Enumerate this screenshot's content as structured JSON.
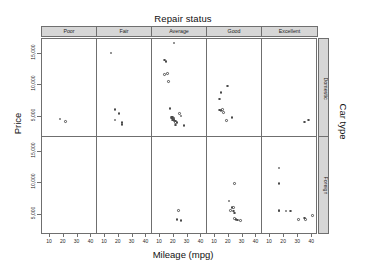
{
  "titles": {
    "top": "Repair status",
    "left": "Price",
    "bottom": "Mileage (mpg)",
    "right": "Car type"
  },
  "colors": {
    "strip_fill": "#d6d6d6",
    "frame": "#6f6f6f",
    "point": "#4a4a4a",
    "background": "#ffffff",
    "text": "#1f1f1f"
  },
  "chart_data": {
    "type": "scatter",
    "title": "Repair status",
    "xlabel": "Mileage (mpg)",
    "ylabel": "Price",
    "right_label": "Car type",
    "grid": false,
    "legend": "none",
    "layout": "trellis 5 columns x 2 rows",
    "columns": [
      "Poor",
      "Fair",
      "Average",
      "Good",
      "Excellent"
    ],
    "rows": [
      "Domestic",
      "Foreign"
    ],
    "xlim": [
      5,
      44
    ],
    "ylim": [
      2500,
      16500
    ],
    "xticks": [
      10,
      20,
      30,
      40
    ],
    "xticklabels": [
      "10",
      "20",
      "30",
      "40"
    ],
    "yticks": [
      5000,
      10000,
      15000
    ],
    "yticklabels": [
      "5,000",
      "10,000",
      "15,000"
    ],
    "panels": [
      {
        "row": "Domestic",
        "col": "Poor",
        "n": 2,
        "points": [
          [
            18,
            4934
          ],
          [
            22,
            4589
          ]
        ]
      },
      {
        "row": "Domestic",
        "col": "Fair",
        "n": 6,
        "points": [
          [
            15,
            14500
          ],
          [
            18,
            6303
          ],
          [
            18,
            4816
          ],
          [
            21,
            5705
          ],
          [
            23,
            4453
          ],
          [
            23,
            4195
          ]
        ]
      },
      {
        "row": "Domestic",
        "col": "Average",
        "n": 23,
        "points": [
          [
            21,
            15906
          ],
          [
            14,
            13466
          ],
          [
            15,
            13291
          ],
          [
            14,
            11385
          ],
          [
            16,
            11497
          ],
          [
            17,
            10372
          ],
          [
            18,
            6486
          ],
          [
            19,
            5222
          ],
          [
            19,
            5079
          ],
          [
            20,
            4816
          ],
          [
            20,
            5104
          ],
          [
            20,
            5222
          ],
          [
            21,
            4723
          ],
          [
            21,
            4800
          ],
          [
            21,
            4934
          ],
          [
            21,
            5104
          ],
          [
            22,
            4647
          ],
          [
            22,
            4425
          ],
          [
            23,
            4482
          ],
          [
            25,
            5788
          ],
          [
            26,
            5379
          ],
          [
            22,
            4060
          ],
          [
            28,
            3984
          ]
        ]
      },
      {
        "row": "Domestic",
        "col": "Good",
        "n": 8,
        "points": [
          [
            20,
            9690
          ],
          [
            15,
            8814
          ],
          [
            14,
            7827
          ],
          [
            14,
            6229
          ],
          [
            16,
            6295
          ],
          [
            15,
            6165
          ],
          [
            17,
            5899
          ],
          [
            19,
            4741
          ],
          [
            23,
            5172
          ]
        ]
      },
      {
        "row": "Domestic",
        "col": "Excellent",
        "n": 2,
        "points": [
          [
            35,
            4504
          ],
          [
            38,
            4816
          ]
        ]
      },
      {
        "row": "Foreign",
        "col": "Poor",
        "n": 0,
        "points": []
      },
      {
        "row": "Foreign",
        "col": "Fair",
        "n": 0,
        "points": []
      },
      {
        "row": "Foreign",
        "col": "Average",
        "n": 3,
        "points": [
          [
            24,
            5799
          ],
          [
            23,
            4499
          ],
          [
            26,
            4296
          ]
        ]
      },
      {
        "row": "Foreign",
        "col": "Good",
        "n": 11,
        "points": [
          [
            25,
            9735
          ],
          [
            21,
            7140
          ],
          [
            23,
            6229
          ],
          [
            24,
            6229
          ],
          [
            22,
            5799
          ],
          [
            24,
            5719
          ],
          [
            25,
            5397
          ],
          [
            25,
            4589
          ],
          [
            26,
            4499
          ],
          [
            27,
            4425
          ],
          [
            29,
            4296
          ]
        ]
      },
      {
        "row": "Foreign",
        "col": "Excellent",
        "n": 10,
        "points": [
          [
            17,
            11995
          ],
          [
            17,
            9735
          ],
          [
            17,
            5719
          ],
          [
            17,
            5799
          ],
          [
            22,
            5719
          ],
          [
            25,
            5719
          ],
          [
            31,
            4499
          ],
          [
            35,
            4697
          ],
          [
            36,
            4499
          ],
          [
            41,
            5079
          ]
        ]
      }
    ]
  }
}
